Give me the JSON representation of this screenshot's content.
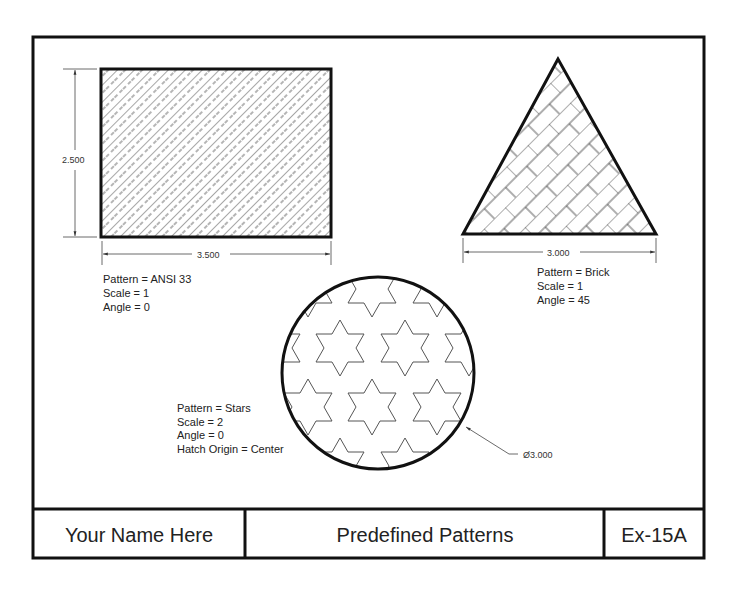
{
  "drawing": {
    "frame": {
      "x": 33,
      "y": 37,
      "width": 671,
      "height": 521
    },
    "rectangle": {
      "x": 101,
      "y": 69,
      "width": 230,
      "height": 168,
      "width_dim": "3.500",
      "height_dim": "2.500",
      "labels": [
        "Pattern = ANSI 33",
        "Scale = 1",
        "Angle = 0"
      ]
    },
    "triangle": {
      "apex": [
        558,
        59
      ],
      "left": [
        463,
        234
      ],
      "right": [
        656,
        234
      ],
      "base_dim": "3.000",
      "labels": [
        "Pattern = Brick",
        "Scale = 1",
        "Angle = 45"
      ]
    },
    "circle": {
      "cx": 378,
      "cy": 373,
      "r": 96,
      "diameter_dim": "Ø3.000",
      "labels": [
        "Pattern = Stars",
        "Scale = 2",
        "Angle = 0",
        "Hatch Origin = Center"
      ]
    }
  },
  "title_block": {
    "name": "Your Name Here",
    "title": "Predefined Patterns",
    "sheet": "Ex-15A"
  }
}
